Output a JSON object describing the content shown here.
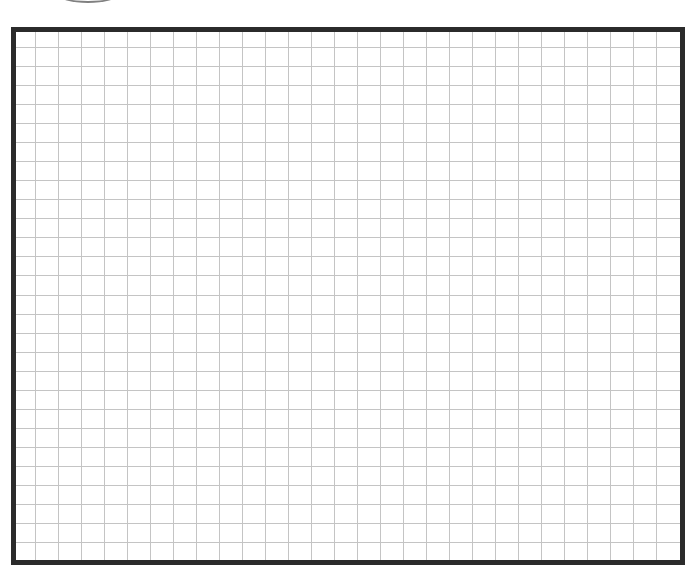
{
  "page": {
    "background": "#ffffff"
  },
  "decoration": {
    "top_arc": {
      "icon": "curved-arc",
      "color": "#6b6b6b"
    }
  },
  "grid_sheet": {
    "border_color": "#2b2b2b",
    "line_color": "#c4c4c4",
    "columns": 29,
    "rows": 28,
    "cell_width_px": 23,
    "cell_height_px": 19.04,
    "first_vertical_offset_px": 19,
    "first_horizontal_offset_px": 15
  }
}
